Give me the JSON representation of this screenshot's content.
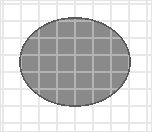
{
  "figure": {
    "canvas": {
      "width": 152,
      "height": 132,
      "background": "#ffffff"
    },
    "frame": {
      "stroke": "#e4e4e4",
      "stroke_width": 1,
      "x": 0.5,
      "y": 0.5,
      "width": 151,
      "height": 131
    },
    "grid": {
      "outside_line_color": "#e8e8e8",
      "inside_line_color": "#b3b3b3",
      "line_width": 1.4,
      "origin_x": 3,
      "origin_y": 4,
      "cell_width": 18,
      "cell_height": 17,
      "columns": 8,
      "rows": 7,
      "vertical_lines": [
        3,
        21,
        39,
        57,
        75,
        93,
        111,
        129,
        147
      ],
      "horizontal_lines": [
        4,
        21,
        38,
        55,
        72,
        89,
        106,
        123
      ]
    },
    "ellipse": {
      "name": "wafer",
      "center_x": 75,
      "center_y": 62,
      "radius_x": 55,
      "radius_y": 44,
      "fill": "#8a8a8a",
      "stroke": "#5a5a5a",
      "stroke_width": 1.6
    }
  }
}
